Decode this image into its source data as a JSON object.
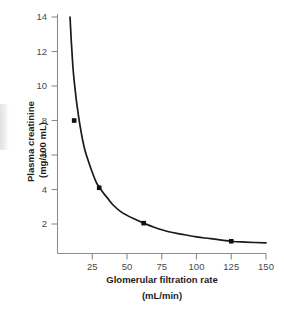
{
  "chart_data": {
    "type": "line",
    "title": "",
    "subtitle": "",
    "xlabel": "Glomerular filtration rate",
    "xlabel_units": "(mL/min)",
    "ylabel": "Plasma creatinine",
    "ylabel_units": "(mg/100 mL)",
    "xlim": [
      0,
      150
    ],
    "ylim": [
      0,
      14
    ],
    "xticks": [
      25,
      50,
      75,
      100,
      125,
      150
    ],
    "xtick_labels": [
      "25",
      "50",
      "75",
      "100",
      "125",
      "150"
    ],
    "yticks": [
      2,
      4,
      6,
      8,
      10,
      12,
      14
    ],
    "ytick_labels": [
      "2",
      "4",
      "6",
      "8",
      "10",
      "12",
      "14"
    ],
    "grid": false,
    "legend": "none",
    "relationship": "plasma creatinine is inversely proportional to GFR (creatinine x GFR = constant, approx 125)",
    "series": [
      {
        "name": "Plasma creatinine vs GFR",
        "marker": "square",
        "marker_color": "#111111",
        "line_color": "#1a1a1a",
        "x": [
          12,
          30,
          62,
          125
        ],
        "y": [
          8.0,
          4.1,
          2.05,
          1.0
        ],
        "curve_x": [
          9,
          10,
          11,
          12,
          14,
          16,
          18,
          20,
          22,
          25,
          28,
          30,
          33,
          36,
          40,
          45,
          50,
          55,
          62,
          70,
          80,
          90,
          100,
          110,
          125,
          135,
          150
        ],
        "curve_y": [
          14.0,
          12.5,
          11.2,
          10.3,
          8.9,
          7.8,
          6.9,
          6.2,
          5.7,
          5.0,
          4.4,
          4.15,
          3.8,
          3.5,
          3.1,
          2.75,
          2.5,
          2.3,
          2.05,
          1.8,
          1.55,
          1.4,
          1.25,
          1.15,
          1.0,
          0.95,
          0.9
        ]
      }
    ]
  },
  "axes": {
    "x_axis_name": "glomerular-filtration-rate-axis",
    "y_axis_name": "plasma-creatinine-axis"
  }
}
